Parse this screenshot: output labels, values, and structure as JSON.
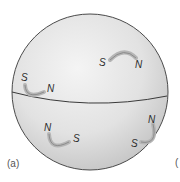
{
  "figure": {
    "panel_label": "(a)",
    "next_panel_fragment": "(",
    "sphere": {
      "fill_light": "#f2f2f2",
      "fill_dark": "#c9c9c9",
      "outline": "#4a4a4a",
      "equator_color": "#3a3a3a"
    },
    "magnets": [
      {
        "id": "upper-right",
        "south": "S",
        "north": "N"
      },
      {
        "id": "upper-left",
        "south": "S",
        "north": "N"
      },
      {
        "id": "lower-left",
        "south": "S",
        "north": "N"
      },
      {
        "id": "lower-right",
        "south": "S",
        "north": "N"
      }
    ],
    "magnet_color": "#9a9a9a"
  }
}
